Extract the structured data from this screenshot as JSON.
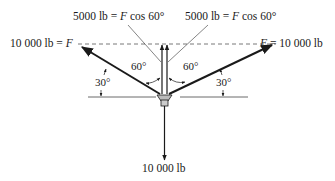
{
  "diagram": {
    "type": "force-diagram",
    "labels": {
      "top_left": {
        "pre": "5000 lb = ",
        "var": "F",
        "post": " cos 60°"
      },
      "top_right": {
        "pre": "5000 lb = ",
        "var": "F",
        "post": " cos 60°"
      },
      "left_force": {
        "pre": "10 000 lb = ",
        "var": "F",
        "post": ""
      },
      "right_force": {
        "pre": "",
        "var": "F",
        "post": " = 10 000 lb"
      },
      "bottom_force": "10 000 lb",
      "angle_left_60": "60°",
      "angle_right_60": "60°",
      "angle_left_30": "30°",
      "angle_right_30": "30°"
    },
    "forces": [
      {
        "name": "left",
        "magnitude": "10 000 lb",
        "angle_from_horizontal_deg": 30,
        "direction": "up-left"
      },
      {
        "name": "right",
        "magnitude": "10 000 lb",
        "angle_from_horizontal_deg": 30,
        "direction": "up-right"
      },
      {
        "name": "vertical-component-left",
        "magnitude": "5000 lb",
        "direction": "up"
      },
      {
        "name": "vertical-component-right",
        "magnitude": "5000 lb",
        "direction": "up"
      },
      {
        "name": "load",
        "magnitude": "10 000 lb",
        "direction": "down"
      }
    ],
    "colors": {
      "line": "#1a1a1a",
      "dashed": "#555555",
      "node_fill": "#bbbbbb"
    }
  }
}
